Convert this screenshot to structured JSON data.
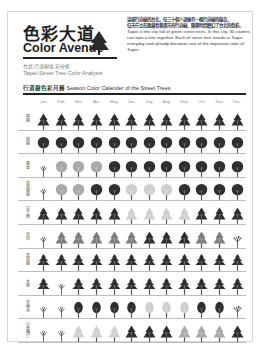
{
  "header": {
    "title_zh": "色彩大道",
    "title_en": "Color Avenue",
    "subtitle_zh": "台北行道樹色彩分析",
    "subtitle_en": "Taipei Street Tree Color Analysis",
    "icon": "tree-icon"
  },
  "intro": {
    "zh_line1": "滿城行道樹的台北，每三十個人就擁有一棵行道樹的綠意，",
    "zh_line2": "每天佇立在路邊看著都市的行道樹，隨著時間變幻了台北的色彩。",
    "en": "Taipei is the city full of green street trees. In this city, 30 citizens can own a tree together. Each of street tree stands in Taipei everyday and already becomes one of the important color of Taipei."
  },
  "calendar": {
    "title_zh": "行道樹色彩月曆",
    "title_en": "Season Color Calender of the Street Trees",
    "months": [
      "Jan.",
      "Feb.",
      "Mar.",
      "Apr.",
      "May.",
      "Jun.",
      "July.",
      "Aug.",
      "Sep.",
      "Oct.",
      "Nov.",
      "Dec."
    ],
    "colors": {
      "dark": "#2e2e2e",
      "mid": "#7d7d7d",
      "light": "#a9a9a9",
      "pale": "#cfcfcf",
      "trunk": "#555555"
    },
    "rows": [
      {
        "label": "樟樹",
        "shape": "cone",
        "states": [
          "dark",
          "dark",
          "dark",
          "dark",
          "dark",
          "dark",
          "dark",
          "dark",
          "dark",
          "dark",
          "dark",
          "dark"
        ]
      },
      {
        "label": "榕樹",
        "shape": "round",
        "states": [
          "dark",
          "dark",
          "dark",
          "dark",
          "dark",
          "dark",
          "dark",
          "dark",
          "dark",
          "dark",
          "dark",
          "dark"
        ]
      },
      {
        "label": "楓香",
        "shape": "round",
        "states": [
          "bare",
          "light",
          "light",
          "light",
          "dark",
          "dark",
          "dark",
          "dark",
          "dark",
          "dark",
          "dark",
          "dark"
        ]
      },
      {
        "label": "台灣欒樹",
        "shape": "round",
        "states": [
          "bare",
          "light",
          "light",
          "dark",
          "dark",
          "pale",
          "pale",
          "pale",
          "dark",
          "dark",
          "dark",
          "dark"
        ]
      },
      {
        "label": "白千層",
        "shape": "cone",
        "states": [
          "dark",
          "dark",
          "dark",
          "dark",
          "dark",
          "pale",
          "pale",
          "pale",
          "pale",
          "dark",
          "dark",
          "dark"
        ]
      },
      {
        "label": "烏桕",
        "shape": "cone",
        "states": [
          "bare",
          "mid",
          "mid",
          "mid",
          "mid",
          "mid",
          "dark",
          "dark",
          "dark",
          "mid",
          "mid",
          "sprout"
        ]
      },
      {
        "label": "黑板樹",
        "shape": "tiered",
        "states": [
          "dark",
          "dark",
          "dark",
          "dark",
          "dark",
          "dark",
          "dark",
          "dark",
          "dark",
          "dark",
          "dark",
          "dark"
        ]
      },
      {
        "label": "木棉",
        "shape": "tiered",
        "states": [
          "dark",
          "bare",
          "dark",
          "dark",
          "dark",
          "dark",
          "dark",
          "dark",
          "dark",
          "dark",
          "dark",
          "dark"
        ]
      },
      {
        "label": "苦楝木",
        "shape": "oval",
        "states": [
          "bare",
          "bare",
          "dark",
          "dark",
          "dark",
          "dark",
          "pale",
          "pale",
          "pale",
          "dark",
          "dark",
          "sprout"
        ]
      },
      {
        "label": "小葉欖仁",
        "shape": "cone",
        "states": [
          "bare",
          "bare",
          "pale",
          "pale",
          "pale",
          "dark",
          "dark",
          "dark",
          "light",
          "light",
          "light",
          "dark"
        ]
      }
    ]
  }
}
